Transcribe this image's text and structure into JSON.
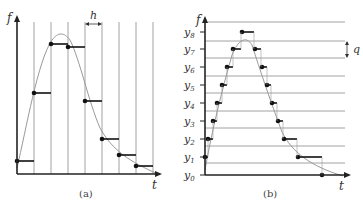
{
  "figure": {
    "panels": [
      {
        "id": "a",
        "caption": "(a)",
        "y_axis_label": "f",
        "x_axis_label": "t",
        "interval_label": "h",
        "description": "Time sampling: vertical lines at uniform spacing h; sample values held constant over each interval",
        "grid_x": [
          34,
          51,
          68,
          85,
          102,
          119,
          136,
          153
        ],
        "samples": [
          {
            "x": 17,
            "y": 161,
            "x_end": 34
          },
          {
            "x": 34,
            "y": 93,
            "x_end": 51
          },
          {
            "x": 51,
            "y": 44,
            "x_end": 68
          },
          {
            "x": 68,
            "y": 47,
            "x_end": 85
          },
          {
            "x": 85,
            "y": 101,
            "x_end": 102
          },
          {
            "x": 102,
            "y": 139,
            "x_end": 119
          },
          {
            "x": 119,
            "y": 155,
            "x_end": 136
          },
          {
            "x": 136,
            "y": 166,
            "x_end": 153
          }
        ],
        "curve_path": "M17,168 C26,130 38,60 52,40 C58,32 64,32 70,40 C80,60 88,100 100,128 C112,150 130,162 158,174"
      },
      {
        "id": "b",
        "caption": "(b)",
        "y_axis_label": "f",
        "x_axis_label": "t",
        "interval_label": "q",
        "description": "Level quantization: horizontal lines at uniform spacing q; samples taken when signal crosses a level",
        "levels": [
          {
            "label": "y",
            "sub": "0",
            "y": 175
          },
          {
            "label": "y",
            "sub": "1",
            "y": 157
          },
          {
            "label": "y",
            "sub": "2",
            "y": 139
          },
          {
            "label": "y",
            "sub": "3",
            "y": 121
          },
          {
            "label": "y",
            "sub": "4",
            "y": 103
          },
          {
            "label": "y",
            "sub": "5",
            "y": 85
          },
          {
            "label": "y",
            "sub": "6",
            "y": 67
          },
          {
            "label": "y",
            "sub": "7",
            "y": 49
          },
          {
            "label": "y",
            "sub": "8",
            "y": 32
          }
        ],
        "grid_y": [
          22,
          41,
          58,
          76,
          93,
          111,
          128,
          146,
          163
        ],
        "samples": [
          {
            "x": 205,
            "y": 157,
            "x_end": 208
          },
          {
            "x": 208,
            "y": 139,
            "x_end": 213
          },
          {
            "x": 213,
            "y": 121,
            "x_end": 217
          },
          {
            "x": 217,
            "y": 103,
            "x_end": 222
          },
          {
            "x": 222,
            "y": 85,
            "x_end": 227
          },
          {
            "x": 227,
            "y": 67,
            "x_end": 233
          },
          {
            "x": 233,
            "y": 49,
            "x_end": 241
          },
          {
            "x": 242,
            "y": 32,
            "x_end": 254
          },
          {
            "x": 255,
            "y": 49,
            "x_end": 261
          },
          {
            "x": 262,
            "y": 67,
            "x_end": 267
          },
          {
            "x": 267,
            "y": 85,
            "x_end": 271
          },
          {
            "x": 272,
            "y": 103,
            "x_end": 277
          },
          {
            "x": 278,
            "y": 121,
            "x_end": 283
          },
          {
            "x": 284,
            "y": 139,
            "x_end": 297
          },
          {
            "x": 298,
            "y": 157,
            "x_end": 322
          },
          {
            "x": 322,
            "y": 175,
            "x_end": 322
          }
        ],
        "curve_path": "M205,170 C212,130 222,90 232,55 C238,40 246,35 252,45 C260,70 270,100 282,132 C292,152 310,166 343,176"
      }
    ]
  }
}
